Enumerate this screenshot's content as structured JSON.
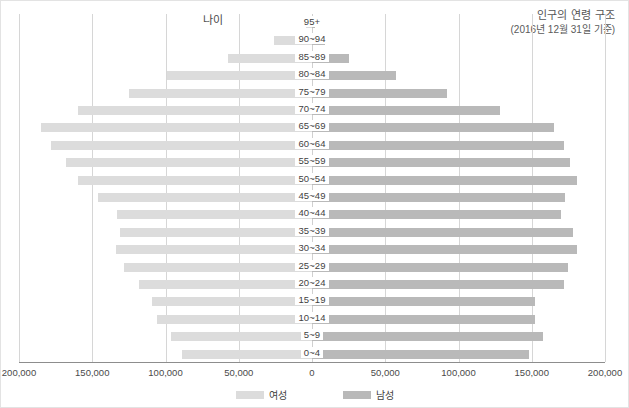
{
  "header": {
    "title": "인구의 연령 구조",
    "subtitle": "(2016년 12월 31일 기준)",
    "y_axis_name": "나이"
  },
  "legend": {
    "female_label": "여성",
    "male_label": "남성",
    "female_color": "#dcdcdc",
    "male_color": "#b9b9b9"
  },
  "xticks": [
    "200,000",
    "150,000",
    "100,000",
    "50,000",
    "0",
    "50,000",
    "100,000",
    "150,000",
    "200,000"
  ],
  "chart_data": {
    "type": "bar",
    "subtype": "population-pyramid",
    "title": "인구의 연령 구조",
    "subtitle": "(2016년 12월 31일 기준)",
    "xlabel": "",
    "ylabel": "나이",
    "xlim": [
      -200000,
      200000
    ],
    "xtick_values": [
      -200000,
      -150000,
      -100000,
      -50000,
      0,
      50000,
      100000,
      150000,
      200000
    ],
    "grid": true,
    "legend_position": "bottom-center",
    "categories": [
      "95+",
      "90~94",
      "85~89",
      "80~84",
      "75~79",
      "70~74",
      "65~69",
      "60~64",
      "55~59",
      "50~54",
      "45~49",
      "40~44",
      "35~39",
      "30~34",
      "25~29",
      "20~24",
      "15~19",
      "10~14",
      "5~9",
      "0~4"
    ],
    "series": [
      {
        "name": "여성",
        "color": "#dcdcdc",
        "direction": "left",
        "values": [
          4000,
          26000,
          57000,
          99000,
          125000,
          160000,
          185000,
          178000,
          168000,
          160000,
          146000,
          133000,
          131000,
          134000,
          128000,
          118000,
          109000,
          106000,
          96000,
          89000
        ]
      },
      {
        "name": "남성",
        "color": "#b9b9b9",
        "direction": "right",
        "values": [
          2000,
          9000,
          25000,
          57000,
          92000,
          128000,
          165000,
          172000,
          176000,
          181000,
          173000,
          170000,
          178000,
          181000,
          175000,
          172000,
          152000,
          152000,
          158000,
          148000
        ]
      }
    ]
  }
}
